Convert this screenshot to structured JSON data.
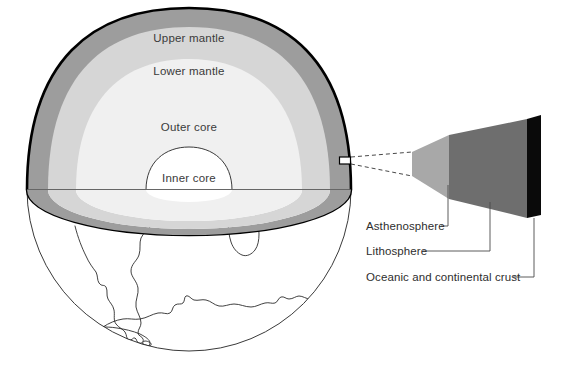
{
  "figure": {
    "background_color": "#ffffff"
  },
  "globe": {
    "outline_color": "#3a3a3a",
    "cutaway_outline_color": "#000000",
    "equator_line_color": "#555555",
    "center_x": 189,
    "center_y": 189,
    "radius": 162,
    "continents_label": "South America, Africa and Antarctica coastlines"
  },
  "layers": [
    {
      "id": "upper-mantle",
      "label": "Upper mantle",
      "color": "#9d9d9d",
      "label_x": 189,
      "label_y": 42
    },
    {
      "id": "lower-mantle",
      "label": "Lower mantle",
      "color": "#d6d6d6",
      "label_x": 189,
      "label_y": 75
    },
    {
      "id": "outer-core",
      "label": "Outer core",
      "color": "#f0f0f0",
      "label_x": 189,
      "label_y": 131
    },
    {
      "id": "inner-core",
      "label": "Inner core",
      "color": "#ffffff",
      "label_x": 189,
      "label_y": 182
    }
  ],
  "magnifier": {
    "marker_label": "crust-sample-marker",
    "marker_x": 340,
    "marker_y": 160,
    "marker_width": 11,
    "marker_height": 7,
    "connector_style": "dashed",
    "bands": [
      {
        "id": "asthenosphere",
        "label": "Asthenosphere",
        "color": "#a8a8a8"
      },
      {
        "id": "lithosphere",
        "label": "Lithosphere",
        "color": "#6e6e6e"
      },
      {
        "id": "oceanic-and-continental-crust",
        "label": "Oceanic and continental crust",
        "color": "#0a0a0a"
      }
    ]
  },
  "callouts": [
    {
      "id": "asthenosphere-callout",
      "label": "Asthenosphere",
      "text_x": 366,
      "text_y": 230
    },
    {
      "id": "lithosphere-callout",
      "label": "Lithosphere",
      "text_x": 366,
      "text_y": 255
    },
    {
      "id": "crust-callout",
      "label": "Oceanic and continental crust",
      "text_x": 366,
      "text_y": 281
    }
  ]
}
